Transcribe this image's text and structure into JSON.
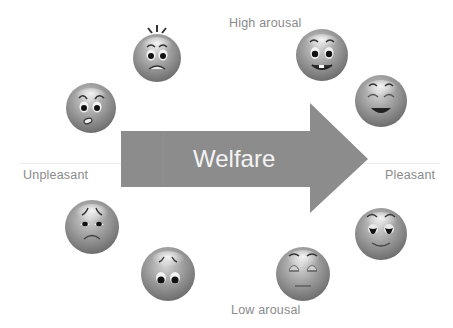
{
  "diagram": {
    "arrow": {
      "label": "Welfare",
      "direction": "right",
      "fill": "#8c8c8c",
      "text_color": "#f4f4f4"
    },
    "axis_labels": {
      "top": "High arousal",
      "bottom": "Low arousal",
      "left": "Unpleasant",
      "right": "Pleasant"
    },
    "label_color": "#8a8a8a",
    "emoticons": [
      {
        "id": "afraid",
        "emotion": "afraid / startled",
        "quadrant": "high arousal, unpleasant"
      },
      {
        "id": "worried",
        "emotion": "angry / worried",
        "quadrant": "unpleasant"
      },
      {
        "id": "excited",
        "emotion": "excited / happy",
        "quadrant": "high arousal, pleasant"
      },
      {
        "id": "laughing",
        "emotion": "laughing / delighted",
        "quadrant": "pleasant"
      },
      {
        "id": "sad",
        "emotion": "sad",
        "quadrant": "unpleasant"
      },
      {
        "id": "depressed",
        "emotion": "depressed / gloomy",
        "quadrant": "low arousal, unpleasant"
      },
      {
        "id": "content",
        "emotion": "content / serene",
        "quadrant": "pleasant"
      },
      {
        "id": "relaxed",
        "emotion": "relaxed / sleepy",
        "quadrant": "low arousal, pleasant"
      }
    ]
  }
}
